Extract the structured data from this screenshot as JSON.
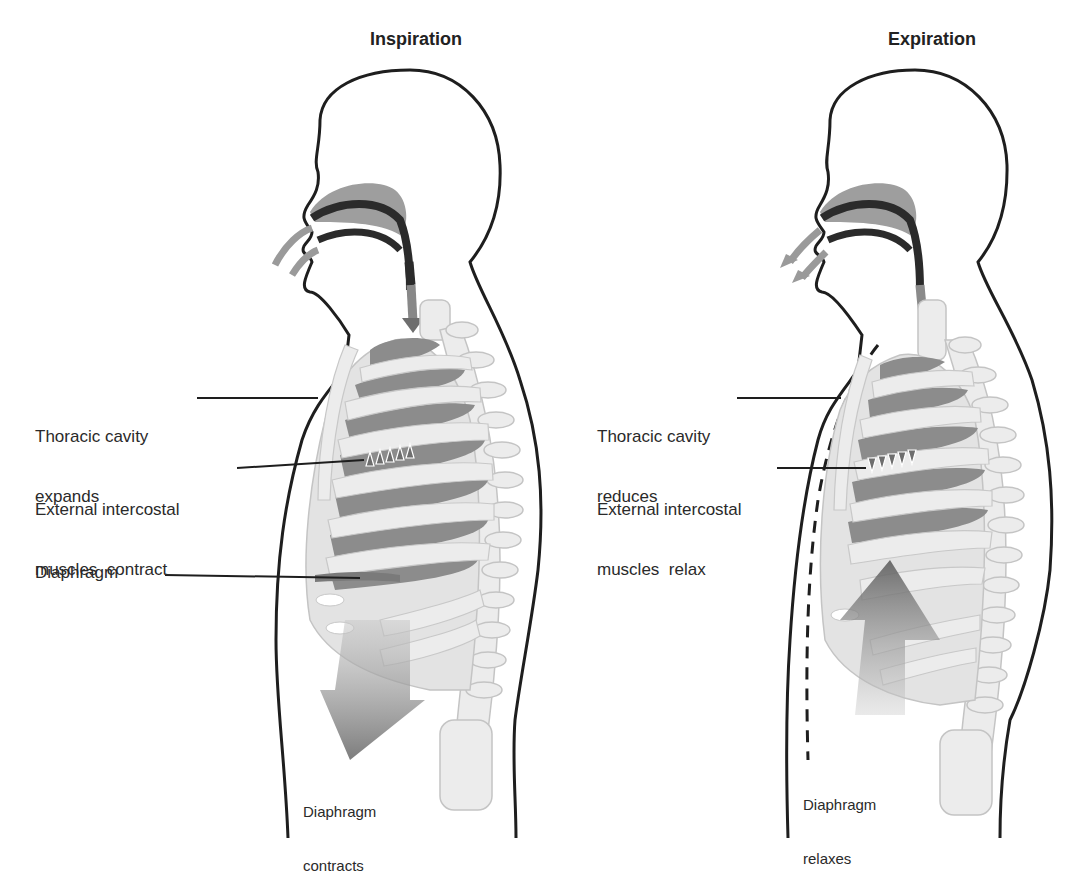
{
  "colors": {
    "outline": "#1e1e1e",
    "airway": "#8a8a8a",
    "airway_dark": "#2b2b2b",
    "rib": "#e6e6e6",
    "rib_edge": "#bdbdbd",
    "lung": "#8c8c8c",
    "arrow": "#9a9a9a",
    "arrow_dark": "#7a7a7a",
    "text": "#2a2a2a"
  },
  "panels": [
    {
      "id": "inspiration",
      "title": "Inspiration",
      "labels": {
        "thoracic": {
          "line1": "Thoracic cavity",
          "line2": "expands"
        },
        "intercostal": {
          "line1": "External intercostal",
          "line2": "muscles  contract"
        },
        "diaphragm": "Diaphragm",
        "diaphragm_action": {
          "line1": "Diaphragm",
          "line2": "contracts"
        }
      },
      "airflow": "in",
      "diaphragm_arrow": "down"
    },
    {
      "id": "expiration",
      "title": "Expiration",
      "labels": {
        "thoracic": {
          "line1": "Thoracic cavity",
          "line2": "reduces"
        },
        "intercostal": {
          "line1": "External intercostal",
          "line2": "muscles  relax"
        },
        "diaphragm_action": {
          "line1": "Diaphragm",
          "line2": "relaxes"
        }
      },
      "airflow": "out",
      "diaphragm_arrow": "up"
    }
  ]
}
